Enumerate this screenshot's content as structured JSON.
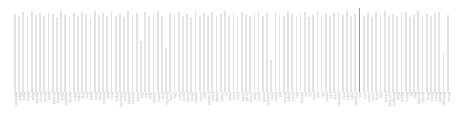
{
  "chart_data": {
    "type": "bar",
    "title": "",
    "subtitle": "",
    "xlabel": "",
    "ylabel": "",
    "grid": false,
    "legend": null,
    "orientation": "vertical",
    "tick_label_rotation": 90,
    "ylim": [
      0,
      100
    ],
    "bar_color": "#e3e3e3",
    "highlight_color": "#9a9a9a",
    "highlight_index": 82,
    "background_color": "#ffffff",
    "categories": [
      "Afghanistan",
      "Albania",
      "Algeria",
      "Andorra",
      "Angola",
      "Argentina",
      "Armenia",
      "Australia",
      "Austria",
      "Azerbaijan",
      "Bahamas",
      "Bahrain",
      "Bangladesh",
      "Barbados",
      "Belarus",
      "Belgium",
      "Belize",
      "Benin",
      "Bhutan",
      "Bolivia",
      "Bosnia",
      "Botswana",
      "Brazil",
      "Brunei",
      "Bulgaria",
      "Burkina Faso",
      "Burundi",
      "Cambodia",
      "Cameroon",
      "Canada",
      "Chad",
      "Chile",
      "China",
      "Colombia",
      "Comoros",
      "Congo",
      "Costa Rica",
      "Croatia",
      "Cuba",
      "Cyprus",
      "Czechia",
      "Denmark",
      "Djibouti",
      "Dominica",
      "Ecuador",
      "Egypt",
      "El Salvador",
      "Estonia",
      "Eswatini",
      "Ethiopia",
      "Fiji",
      "Finland",
      "France",
      "Gabon",
      "Gambia",
      "Georgia",
      "Germany",
      "Ghana",
      "Greece",
      "Grenada",
      "Guatemala",
      "Guinea",
      "Guyana",
      "Haiti",
      "Honduras",
      "Hungary",
      "Iceland",
      "India",
      "Indonesia",
      "Iran",
      "Iraq",
      "Ireland",
      "Israel",
      "Italy",
      "Jamaica",
      "Japan",
      "Jordan",
      "Kazakhstan",
      "Kenya",
      "Kiribati",
      "Kuwait",
      "Kyrgyzstan",
      "Laos",
      "Latvia",
      "Lebanon",
      "Lesotho",
      "Liberia",
      "Libya",
      "Lithuania",
      "Luxembourg",
      "Madagascar",
      "Malawi",
      "Malaysia",
      "Maldives",
      "Mali",
      "Malta",
      "Mauritania",
      "Mauritius",
      "Mexico",
      "Moldova",
      "Monaco",
      "Mongolia",
      "Montenegro",
      "Morocco"
    ],
    "values": [
      93,
      91,
      95,
      90,
      96,
      92,
      94,
      91,
      95,
      93,
      89,
      96,
      92,
      90,
      94,
      91,
      95,
      93,
      88,
      96,
      92,
      94,
      90,
      95,
      91,
      93,
      89,
      96,
      92,
      94,
      61,
      95,
      90,
      93,
      96,
      91,
      52,
      94,
      92,
      95,
      90,
      93,
      89,
      96,
      91,
      94,
      92,
      95,
      90,
      93,
      96,
      91,
      94,
      89,
      95,
      92,
      90,
      93,
      96,
      91,
      94,
      38,
      95,
      92,
      90,
      96,
      93,
      91,
      94,
      95,
      89,
      92,
      96,
      90,
      93,
      91,
      94,
      95,
      92,
      96,
      90,
      93,
      100,
      91,
      94,
      89,
      95,
      92,
      96,
      90,
      93,
      91,
      94,
      95,
      89,
      92,
      96,
      90,
      93,
      91,
      94,
      95,
      46,
      92
    ]
  }
}
